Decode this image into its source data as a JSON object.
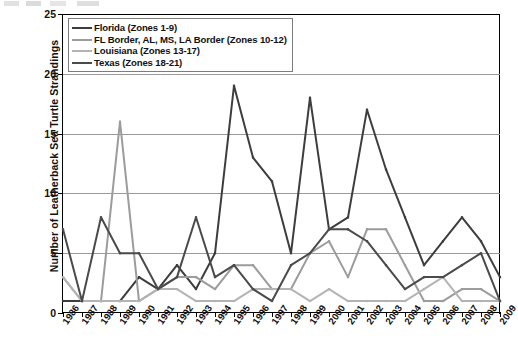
{
  "chart_data": {
    "type": "line",
    "title": "",
    "xlabel": "",
    "ylabel": "Number of Leatherback Sea Turtle Strandings",
    "ylim": [
      0,
      25
    ],
    "yticks": [
      0,
      5,
      10,
      15,
      20,
      25
    ],
    "grid": true,
    "legend_position": "top-left",
    "categories": [
      "1986",
      "1987",
      "1988",
      "1989",
      "1990",
      "1991",
      "1992",
      "1993",
      "1994",
      "1995",
      "1996",
      "1997",
      "1998",
      "1999",
      "2000",
      "2001",
      "2002",
      "2003",
      "2004",
      "2005",
      "2006",
      "2007",
      "2008",
      "2009"
    ],
    "series": [
      {
        "name": "Florida (Zones 1-9)",
        "color": "#3d3d3d",
        "values": [
          1,
          1,
          1,
          1,
          3,
          2,
          4,
          2,
          5,
          19,
          13,
          11,
          5,
          18,
          7,
          8,
          17,
          12,
          8,
          4,
          6,
          8,
          6,
          3
        ]
      },
      {
        "name": "FL Border, AL, MS, LA Border (Zones 10-12)",
        "color": "#9c9c9c",
        "values": [
          3,
          1,
          1,
          16,
          1,
          2,
          3,
          3,
          2,
          4,
          4,
          2,
          2,
          5,
          6,
          3,
          7,
          7,
          4,
          1,
          1,
          2,
          2,
          1
        ]
      },
      {
        "name": "Louisiana (Zones 13-17)",
        "color": "#b4b4b4",
        "values": [
          3,
          1,
          1,
          1,
          1,
          2,
          2,
          1,
          1,
          1,
          2,
          2,
          2,
          1,
          2,
          1,
          1,
          1,
          1,
          2,
          3,
          1,
          1,
          1
        ]
      },
      {
        "name": "Texas (Zones 18-21)",
        "color": "#4a4a4a",
        "values": [
          7,
          1,
          8,
          5,
          5,
          2,
          3,
          8,
          3,
          4,
          2,
          1,
          4,
          5,
          7,
          7,
          6,
          4,
          2,
          3,
          3,
          4,
          5,
          1
        ]
      }
    ]
  },
  "axes": {
    "y_title": "Number of Leatherback Sea Turtle Strandings",
    "y_tick_labels": [
      "0",
      "5",
      "10",
      "15",
      "20",
      "25"
    ],
    "x_tick_labels": [
      "1986",
      "1987",
      "1988",
      "1989",
      "1990",
      "1991",
      "1992",
      "1993",
      "1994",
      "1995",
      "1996",
      "1997",
      "1998",
      "1999",
      "2000",
      "2001",
      "2002",
      "2003",
      "2004",
      "2005",
      "2006",
      "2007",
      "2008",
      "2009"
    ]
  },
  "legend": {
    "entries": [
      {
        "label": "Florida (Zones 1-9)",
        "color": "#3d3d3d"
      },
      {
        "label": "FL Border, AL, MS, LA Border (Zones 10-12)",
        "color": "#9c9c9c"
      },
      {
        "label": "Louisiana (Zones 13-17)",
        "color": "#b4b4b4"
      },
      {
        "label": "Texas (Zones 18-21)",
        "color": "#4a4a4a"
      }
    ]
  }
}
